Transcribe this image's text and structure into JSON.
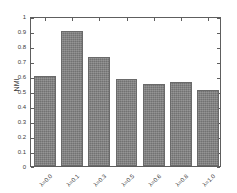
{
  "chart_data": {
    "type": "bar",
    "title": "",
    "xlabel": "",
    "ylabel": "NMI",
    "categories": [
      "λ=0.0",
      "λ=0.1",
      "λ=0.3",
      "λ=0.5",
      "λ=0.6",
      "λ=0.8",
      "λ=1.0"
    ],
    "values": [
      0.6,
      0.9,
      0.73,
      0.58,
      0.55,
      0.56,
      0.505
    ],
    "ylim": [
      0,
      1
    ],
    "ytick_labels": [
      "0",
      "0.1",
      "0.2",
      "0.3",
      "0.4",
      "0.5",
      "0.6",
      "0.7",
      "0.8",
      "0.9",
      "1"
    ],
    "ytick_values": [
      0,
      0.1,
      0.2,
      0.3,
      0.4,
      0.5,
      0.6,
      0.7,
      0.8,
      0.9,
      1
    ],
    "grid": false,
    "legend": null,
    "bar_color": "#7d7d7d",
    "axis_color": "#5e5e5e",
    "background": "#ffffff"
  }
}
